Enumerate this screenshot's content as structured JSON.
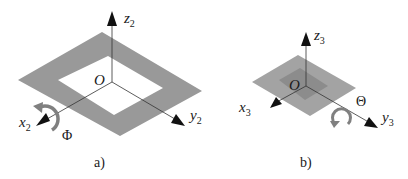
{
  "figure": {
    "colors": {
      "plate": "#999999",
      "plate_light": "#a6a6a6",
      "plate_dark": "#8a8a8a",
      "hole": "#ffffff",
      "axis": "#333333",
      "arrow": "#111111",
      "rotation_arrow": "#808080"
    },
    "panels": [
      {
        "id": "a",
        "caption": "a)",
        "origin_label": "O",
        "axes": {
          "z": {
            "letter": "z",
            "subscript": "2"
          },
          "y": {
            "letter": "y",
            "subscript": "2"
          },
          "x": {
            "letter": "x",
            "subscript": "2"
          }
        },
        "rotation": {
          "symbol": "Φ",
          "about_axis": "x2"
        },
        "shape": "square frame plate with square opening"
      },
      {
        "id": "b",
        "caption": "b)",
        "origin_label": "O",
        "axes": {
          "z": {
            "letter": "z",
            "subscript": "3"
          },
          "y": {
            "letter": "y",
            "subscript": "3"
          },
          "x": {
            "letter": "x",
            "subscript": "3"
          }
        },
        "rotation": {
          "symbol": "Θ",
          "about_axis": "y3"
        },
        "shape": "square plate with darker central square"
      }
    ]
  }
}
